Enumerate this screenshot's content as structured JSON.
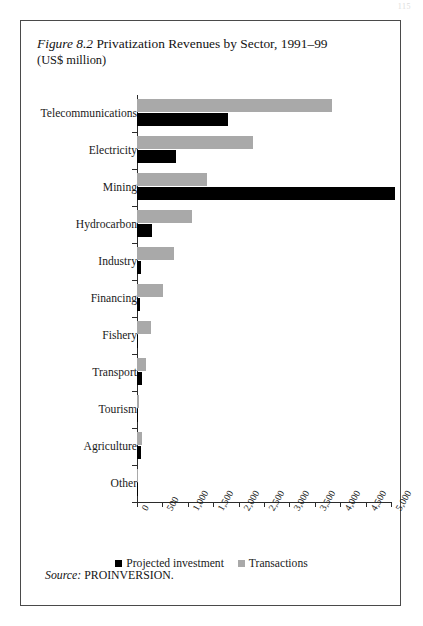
{
  "page": {
    "page_number": "115"
  },
  "figure": {
    "label": "Figure 8.2",
    "title": "Privatization Revenues by Sector, 1991–99",
    "units": "(US$ million)",
    "source_keyword": "Source:",
    "source_text": "PROINVERSION."
  },
  "legend": {
    "position": "bottom-center",
    "items": [
      {
        "label": "Projected investment",
        "color": "#000000"
      },
      {
        "label": "Transactions",
        "color": "#a9a9a9"
      }
    ]
  },
  "chart_data": {
    "type": "bar",
    "orientation": "horizontal",
    "title": "Figure 8.2 Privatization Revenues by Sector, 1991–99",
    "subtitle": "(US$ million)",
    "xlabel": "",
    "ylabel": "",
    "xlim": [
      0,
      5000
    ],
    "xticks": [
      0,
      500,
      1000,
      1500,
      2000,
      2500,
      3000,
      3500,
      4000,
      4500,
      5000
    ],
    "xtick_labels": [
      "0",
      "500",
      "1,000",
      "1,500",
      "2,000",
      "2,500",
      "3,000",
      "3,500",
      "4,000",
      "4,500",
      "5,000"
    ],
    "grid": false,
    "legend_position": "bottom",
    "categories": [
      "Telecommunications",
      "Electricity",
      "Mining",
      "Hydrocarbon",
      "Industry",
      "Financing",
      "Fishery",
      "Transport",
      "Tourism",
      "Agriculture",
      "Other"
    ],
    "series": [
      {
        "name": "Transactions",
        "color": "#a9a9a9",
        "values": [
          3840,
          2280,
          1370,
          1075,
          735,
          520,
          270,
          175,
          40,
          105,
          10
        ]
      },
      {
        "name": "Projected investment",
        "color": "#000000",
        "values": [
          1790,
          770,
          5085,
          300,
          80,
          55,
          15,
          95,
          5,
          75,
          5
        ]
      }
    ]
  }
}
